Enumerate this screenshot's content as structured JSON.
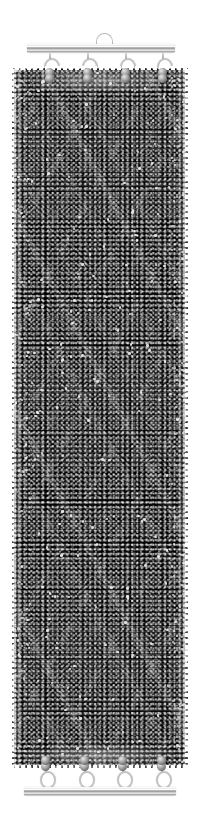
{
  "image": {
    "subject": "beaded bracelet",
    "title": "Black and silver seed-bead herringbone bracelet",
    "background_color": "#ffffff",
    "canvas": {
      "width": 201,
      "height": 825
    }
  },
  "clasp": {
    "type": "slide-tube bar clasp",
    "metal_color": "#c9c9c9",
    "top": {
      "name": "top clasp bar",
      "x": 27,
      "y": 44,
      "width": 148,
      "loop": {
        "name": "hanging loop",
        "x": 96,
        "y": 33,
        "width": 15,
        "height": 11
      },
      "ring_count": 4,
      "ring_x": [
        44,
        82,
        120,
        157
      ],
      "ring_y": 58
    },
    "bottom": {
      "name": "bottom clasp bar",
      "x": 24,
      "y": 787,
      "width": 152,
      "ring_count": 4,
      "ring_x": [
        40,
        79,
        117,
        156
      ],
      "ring_y": 771
    }
  },
  "band": {
    "name": "woven bead band",
    "x": 12,
    "y": 68,
    "width": 176,
    "height": 700,
    "weave": "herringbone / chevron diagonal",
    "bead_colors": {
      "primary": "#0a0a0a",
      "highlight": "#b4b4b4",
      "accent_edge": "#e8e8e8",
      "shadow": "#000000"
    },
    "edge_style": "picot scalloped silver edging"
  },
  "labels": {
    "alt": "Wide cuff bracelet of black and metallic silver seed beads woven in a diagonal chevron pattern, finished with silver slide bar clasps top and bottom"
  }
}
